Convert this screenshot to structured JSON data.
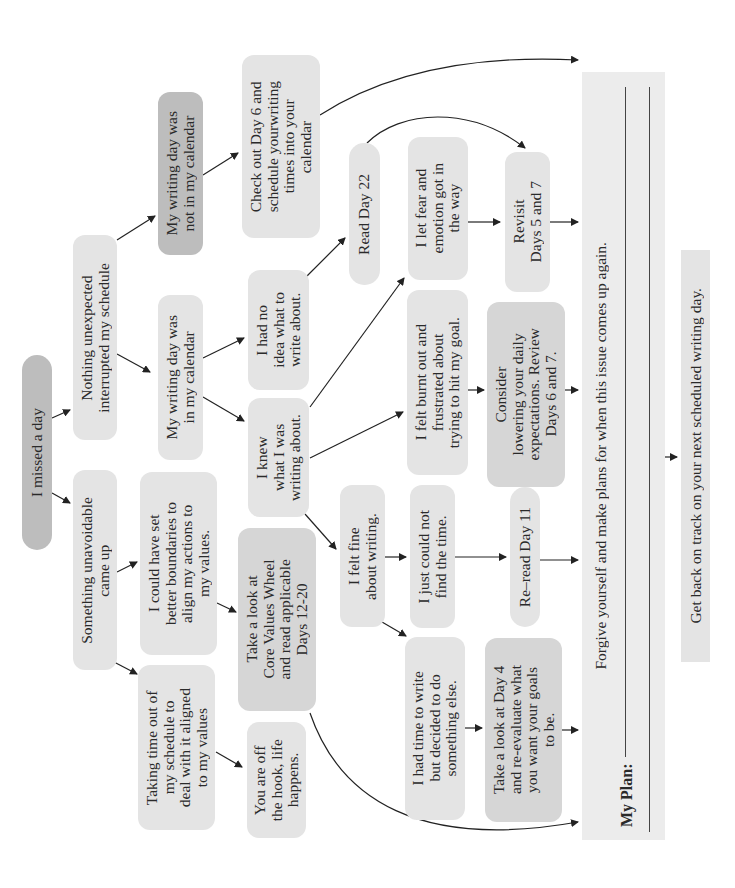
{
  "diagram": {
    "orientation": "rotated 90 degrees counter-clockwise",
    "colors": {
      "light_box": "#e4e4e4",
      "mid_box": "#d6d6d6",
      "dark_box": "#bdbdbd",
      "arrow": "#222222",
      "panel": "#ececec"
    },
    "nodes": {
      "missed": "I missed a day",
      "nothing_unexpected": "Nothing unexpected\ninterrupted my schedule",
      "something_unavoidable": "Something unavoidable\ncame up",
      "not_in_calendar": "My writing day was\nnot in my calendar",
      "in_calendar": "My writing day was\nin my calendar",
      "better_boundaries": "I could have set\nbetter boundaries to\nalign my actions to\nmy values.",
      "taking_time": "Taking time out of\nmy schedule to\ndeal with it aligned\nto my values",
      "check_day6": "Check out Day 6 and\nschedule yourwriting\ntimes into your\ncalendar",
      "no_idea": "I had no\nidea what to\nwrite about.",
      "knew": "I knew\nwhat I was\nwriting about.",
      "core_values": "Take a look at\nCore Values Wheel\nand read applicable\nDays 12-20",
      "off_hook": "You are off\nthe hook, life\nhappens.",
      "read_day22": "Read Day 22",
      "fear_emotion": "I let fear and\nemotion got in\nthe way",
      "burnt_out": "I felt burnt out and\nfrustrated about\ntrying to hit my goal.",
      "felt_fine": "I felt fine\nabout writing.",
      "no_time": "I just could not\nfind the time.",
      "reread_day11": "Re–read Day 11",
      "had_time": "I had time to write\nbut decided to do\nsomething else.",
      "revisit_5_7": "Revisit\nDays 5 and 7",
      "consider_lowering": "Consider\nlowering your daily\nexpectations. Review\nDays 6 and 7.",
      "day4": "Take a look at Day 4\nand re-evaluate what\nyou want your goals\nto be."
    },
    "panel": {
      "forgive_text": "Forgive yourself and make plans for when this issue comes up again.",
      "plan_label": "My Plan:"
    },
    "final": "Get back on track on your next scheduled writing day."
  }
}
